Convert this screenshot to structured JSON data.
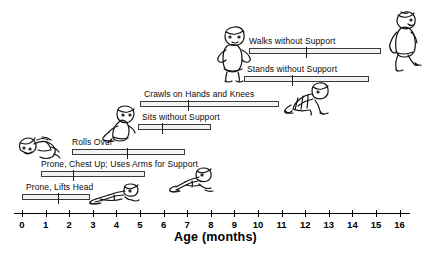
{
  "chart_data": {
    "type": "bar",
    "title": "",
    "xlabel": "Age (months)",
    "ylabel": "",
    "xlim": [
      0,
      16
    ],
    "grid": false,
    "legend": null,
    "orientation": "horizontal-range",
    "note": "Horizontal range bars show the span of ages at which each motor milestone is typically achieved; the vertical tick inside each bar marks the median age.",
    "categories": [
      "Prone, Lifts Head",
      "Prone, Chest Up; Uses Arms for Support",
      "Rolls Over",
      "Sits without Support",
      "Crawls on Hands and Knees",
      "Stands without Support",
      "Walks without Support"
    ],
    "series": [
      {
        "name": "Age range (months)",
        "ranges": [
          [
            0.0,
            2.9
          ],
          [
            0.8,
            5.2
          ],
          [
            2.1,
            6.9
          ],
          [
            4.9,
            8.0
          ],
          [
            5.0,
            10.9
          ],
          [
            9.4,
            14.7
          ],
          [
            9.6,
            15.2
          ]
        ]
      },
      {
        "name": "Median age (months)",
        "values": [
          1.5,
          2.1,
          4.4,
          5.9,
          7.0,
          11.4,
          12.0
        ]
      }
    ],
    "xticks": [
      0,
      1,
      2,
      3,
      4,
      5,
      6,
      7,
      8,
      9,
      10,
      11,
      12,
      13,
      14,
      15,
      16
    ],
    "xticklabels": [
      "0",
      "1",
      "2",
      "3",
      "4",
      "5",
      "6",
      "7",
      "8",
      "9",
      "10",
      "11",
      "12",
      "13",
      "14",
      "15",
      "16"
    ]
  },
  "axis": {
    "title": "Age (months)",
    "ticks": [
      "0",
      "1",
      "2",
      "3",
      "4",
      "5",
      "6",
      "7",
      "8",
      "9",
      "10",
      "11",
      "12",
      "13",
      "14",
      "15",
      "16"
    ]
  },
  "milestones": [
    {
      "id": "walks-without-support",
      "label": "Walks without Support",
      "start": 9.6,
      "end": 15.2,
      "median": 12.0,
      "figure": "toddler-walking-icon"
    },
    {
      "id": "stands-without-support",
      "label": "Stands without Support",
      "start": 9.4,
      "end": 14.7,
      "median": 11.4,
      "figure": "toddler-standing-icon"
    },
    {
      "id": "crawls-on-hands-and-knees",
      "label": "Crawls on Hands and Knees",
      "start": 5.0,
      "end": 10.9,
      "median": 7.0,
      "figure": "baby-crawling-icon"
    },
    {
      "id": "sits-without-support",
      "label": "Sits without Support",
      "start": 4.9,
      "end": 8.0,
      "median": 5.9,
      "figure": "baby-sitting-icon"
    },
    {
      "id": "rolls-over",
      "label": "Rolls Over",
      "start": 2.1,
      "end": 6.9,
      "median": 4.4,
      "figure": "baby-rolling-icon"
    },
    {
      "id": "prone-chest-up-uses-arms-for-support",
      "label": "Prone, Chest Up; Uses Arms for Support",
      "start": 0.8,
      "end": 5.2,
      "median": 2.1,
      "figure": "baby-prone-chest-up-icon"
    },
    {
      "id": "prone-lifts-head",
      "label": "Prone, Lifts Head",
      "start": 0.0,
      "end": 2.9,
      "median": 1.5,
      "figure": "baby-prone-lifting-head-icon"
    }
  ],
  "colors": {
    "bar_fill": "#f2f2f2",
    "bar_stroke": "#3b3b3b",
    "ink": "#000000",
    "background": "#ffffff"
  }
}
